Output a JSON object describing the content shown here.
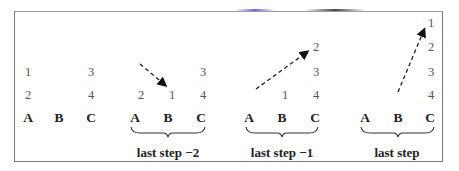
{
  "panels": [
    {
      "name": "initial",
      "pegs": [
        "A",
        "B",
        "C"
      ],
      "stacks": {
        "A": [
          "1",
          "2"
        ],
        "B": [],
        "C": [
          "3",
          "4"
        ]
      },
      "caption": null
    },
    {
      "name": "last-step-minus-2",
      "pegs": [
        "A",
        "B",
        "C"
      ],
      "stacks": {
        "A": [
          "2"
        ],
        "B": [
          "1"
        ],
        "C": [
          "3",
          "4"
        ]
      },
      "arrow": "from above-left onto B",
      "caption": "last step  −2"
    },
    {
      "name": "last-step-minus-1",
      "pegs": [
        "A",
        "B",
        "C"
      ],
      "stacks": {
        "A": [],
        "B": [
          "1"
        ],
        "C": [
          "2",
          "3",
          "4"
        ]
      },
      "arrow": "from A to top of C",
      "caption": "last step  −1"
    },
    {
      "name": "last-step",
      "pegs": [
        "A",
        "B",
        "C"
      ],
      "stacks": {
        "A": [],
        "B": [],
        "C": [
          "1",
          "2",
          "3",
          "4"
        ]
      },
      "arrow": "from B to top of C",
      "caption": "last step"
    }
  ],
  "labels": {
    "p1": {
      "a1": "1",
      "a2": "2",
      "c3": "3",
      "c4": "4",
      "A": "A",
      "B": "B",
      "C": "C"
    },
    "p2": {
      "c3": "3",
      "a2": "2",
      "b1": "1",
      "c4": "4",
      "A": "A",
      "B": "B",
      "C": "C",
      "caption": "last step  −2"
    },
    "p3": {
      "c2": "2",
      "c3": "3",
      "b1": "1",
      "c4": "4",
      "A": "A",
      "B": "B",
      "C": "C",
      "caption": "last step  −1"
    },
    "p4": {
      "c1": "1",
      "c2": "2",
      "c3": "3",
      "c4": "4",
      "A": "A",
      "B": "B",
      "C": "C",
      "caption": "last step"
    }
  }
}
